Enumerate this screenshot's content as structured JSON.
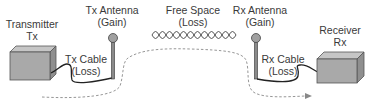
{
  "diagram": {
    "type": "rf-link-budget",
    "components": {
      "transmitter": {
        "line1": "Transmitter",
        "line2": "Tx"
      },
      "tx_cable": {
        "line1": "Tx Cable",
        "line2": "(Loss)"
      },
      "tx_antenna": {
        "line1": "Tx Antenna",
        "line2": "(Gain)"
      },
      "free_space": {
        "line1": "Free Space",
        "line2": "(Loss)"
      },
      "rx_antenna": {
        "line1": "Rx Antenna",
        "line2": "(Gain)"
      },
      "rx_cable": {
        "line1": "Rx Cable",
        "line2": "(Loss)"
      },
      "receiver": {
        "line1": "Receiver",
        "line2": "Rx"
      }
    },
    "colors": {
      "box_fill": "#a9a9a9",
      "box_top": "#c4c4c4",
      "box_side": "#8e8e8e",
      "line": "#333333",
      "antenna_ball": "#a0a0a0",
      "dashed_path": "#888888"
    }
  }
}
